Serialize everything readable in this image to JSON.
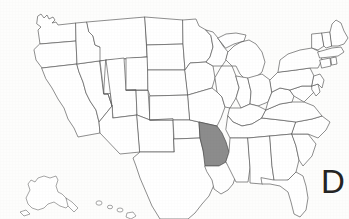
{
  "figure": {
    "kind": "map",
    "background_color": "#fdfdfc",
    "outline_color": "#5d5d5d",
    "highlight_color": "#8c8c8c",
    "width": 349,
    "height": 219
  },
  "choice": {
    "letter": "D"
  },
  "map": {
    "region_label": "United States",
    "highlighted_state": {
      "name": "Arkansas",
      "fill": "#8c8c8c",
      "bbox": [
        199,
        132,
        30,
        34
      ]
    },
    "insets": [
      {
        "name": "Alaska"
      },
      {
        "name": "Hawaii"
      }
    ],
    "visible_states": [
      "Washington",
      "Oregon",
      "California",
      "Nevada",
      "Idaho",
      "Montana",
      "Wyoming",
      "Utah",
      "Arizona",
      "Colorado",
      "New Mexico",
      "North Dakota",
      "South Dakota",
      "Nebraska",
      "Kansas",
      "Oklahoma",
      "Texas",
      "Minnesota",
      "Iowa",
      "Missouri",
      "Arkansas",
      "Louisiana",
      "Wisconsin",
      "Illinois",
      "Michigan",
      "Indiana",
      "Ohio",
      "Kentucky",
      "Tennessee",
      "Mississippi",
      "Alabama",
      "Georgia",
      "Florida",
      "South Carolina",
      "North Carolina",
      "Virginia",
      "West Virginia",
      "Maryland",
      "Delaware",
      "Pennsylvania",
      "New Jersey",
      "New York",
      "Connecticut",
      "Rhode Island",
      "Massachusetts",
      "Vermont",
      "New Hampshire",
      "Maine",
      "Alaska",
      "Hawaii"
    ]
  }
}
